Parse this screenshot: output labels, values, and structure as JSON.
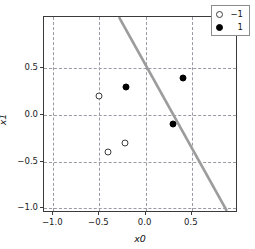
{
  "chart_data": {
    "type": "scatter",
    "title": "",
    "xlabel": "x0",
    "ylabel": "x1",
    "xlim": [
      -1.1,
      1.0
    ],
    "ylim": [
      -1.05,
      1.05
    ],
    "grid": true,
    "xticks": [
      -1.0,
      -0.5,
      0.0,
      0.5
    ],
    "yticks": [
      0.5,
      0.0,
      -0.5,
      -1.0
    ],
    "xtick_labels": [
      "−1.0",
      "−0.5",
      "0.0",
      "0.5"
    ],
    "ytick_labels": [
      "0.5",
      "0.0",
      "−0.5",
      "−1.0"
    ],
    "legend_position": "upper right",
    "series": [
      {
        "name": "-1",
        "legend_label": "−1",
        "marker": "open-circle",
        "color": "#ffffff",
        "edge_color": "#3c3c3c",
        "points": [
          {
            "x": -0.5,
            "y": 0.2
          },
          {
            "x": -0.41,
            "y": -0.4
          },
          {
            "x": -0.22,
            "y": -0.3
          }
        ]
      },
      {
        "name": "1",
        "legend_label": "1",
        "marker": "filled-circle",
        "color": "#000000",
        "edge_color": "#000000",
        "points": [
          {
            "x": -0.21,
            "y": 0.3
          },
          {
            "x": 0.4,
            "y": 0.4
          },
          {
            "x": 0.3,
            "y": -0.1
          }
        ]
      }
    ],
    "annotations": [
      {
        "type": "decision-boundary-line",
        "color": "#9c9c9c",
        "x_start": -0.28,
        "y_start": 1.05,
        "x_end": 0.9,
        "y_end": -1.05
      }
    ]
  },
  "axes": {
    "x_label": "x0",
    "y_label": "x1"
  },
  "legend": {
    "entries": [
      {
        "label": "−1",
        "marker": "open-circle"
      },
      {
        "label": "1",
        "marker": "filled-circle"
      }
    ]
  }
}
